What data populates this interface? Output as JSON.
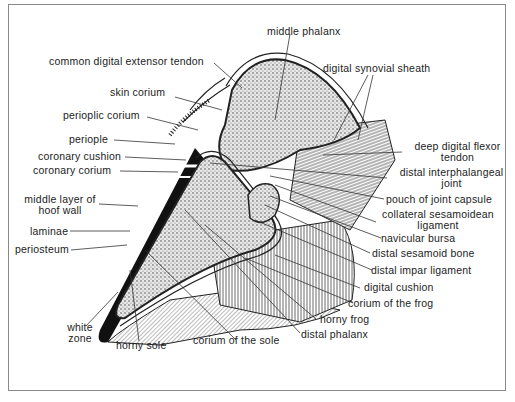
{
  "figure": {
    "type": "cross-section diagram",
    "labels": {
      "middle_phalanx": "middle phalanx",
      "common_digital_extensor_tendon": "common digital extensor tendon",
      "digital_synovial_sheath": "digital synovial sheath",
      "skin_corium": "skin corium",
      "perioplic_corium": "perioplic corium",
      "periople": "periople",
      "coronary_cushion": "coronary cushion",
      "coronary_corium": "coronary corium",
      "deep_digital_flexor_tendon_1": "deep digital flexor",
      "deep_digital_flexor_tendon_2": "tendon",
      "distal_interphalangeal_joint_1": "distal interphalangeal",
      "distal_interphalangeal_joint_2": "joint",
      "pouch_of_joint_capsule": "pouch of joint capsule",
      "collateral_sesamoidean_ligament_1": "collateral sesamoidean",
      "collateral_sesamoidean_ligament_2": "ligament",
      "middle_layer_of_hoof_wall_1": "middle layer of",
      "middle_layer_of_hoof_wall_2": "hoof wall",
      "laminae": "laminae",
      "periosteum": "periosteum",
      "navicular_bursa": "navicular bursa",
      "distal_sesamoid_bone": "distal sesamoid bone",
      "distal_impar_ligament": "distal impar ligament",
      "digital_cushion": "digital cushion",
      "corium_of_the_frog": "corium of the frog",
      "horny_frog": "horny frog",
      "distal_phalanx": "distal phalanx",
      "white_zone_1": "white",
      "white_zone_2": "zone",
      "horny_sole": "horny sole",
      "corium_of_the_sole": "corium of the sole"
    },
    "colors": {
      "line": "#333333",
      "wall": "#111111",
      "frame": "#8a8a8a"
    }
  }
}
